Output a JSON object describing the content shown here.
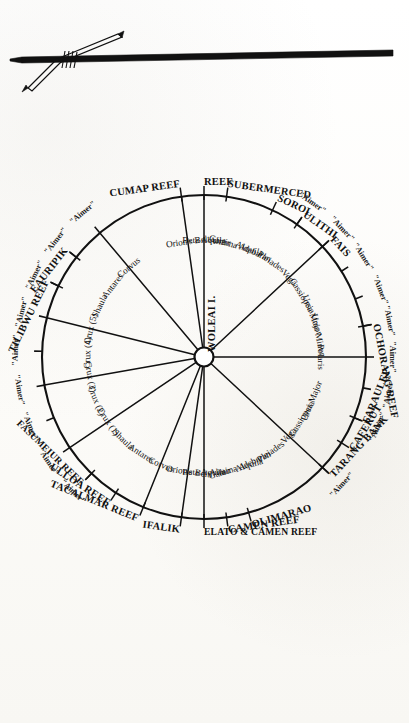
{
  "figure": {
    "center_label": "WOLEAI I.",
    "instrument": "crossed-sticks-navigation-charm",
    "aimer_label": "\"Aimer\"",
    "ink_color": "#111111",
    "paper_color": "#fdfdfb"
  },
  "caption": {
    "text": ""
  },
  "chart_data": {
    "type": "radial-compass",
    "center": "WOLEAI I.",
    "note": "Rotated 90° clockwise on the page. Inner radial labels are star / constellation bearings; outer labels are island and reef destinations; short ticks outside the circle are marked \"Aimer\".",
    "rays": [
      {
        "destination": "FARAULEP",
        "star": "Ursa Major",
        "angle_deg": 292
      },
      {
        "destination": "CAFERUT",
        "star": "Cassiopeia",
        "angle_deg": 302
      },
      {
        "destination": "TARANG BANK",
        "star": "Vega",
        "angle_deg": 313
      },
      {
        "destination": "",
        "star": "Pleiades",
        "angle_deg": 325
      },
      {
        "destination": "",
        "star": "Aldebaran",
        "angle_deg": 335
      },
      {
        "destination": "OLIMARAO",
        "star": "Gamma Aquila",
        "angle_deg": 344
      },
      {
        "destination": "CAMEN REEF",
        "star": "Altair",
        "angle_deg": 352
      },
      {
        "destination": "ELATO & CAMEN REEF",
        "star": "Beta Aquila",
        "angle_deg": 0
      },
      {
        "destination": "IFALIK",
        "star": "Orion's Belt",
        "angle_deg": 8
      },
      {
        "destination": "TACALMAR REEF",
        "star": "Corvus",
        "angle_deg": 22
      },
      {
        "destination": "ULLOA REEF",
        "star": "Antares",
        "angle_deg": 33
      },
      {
        "destination": "FASUMEIUR REEF",
        "star": "Shaula",
        "angle_deg": 44
      },
      {
        "destination": "",
        "star": "Crux (1)",
        "angle_deg": 56
      },
      {
        "destination": "",
        "star": "Crux (2)",
        "angle_deg": 68
      },
      {
        "destination": "",
        "star": "Crux (3)",
        "angle_deg": 80
      },
      {
        "destination": "",
        "star": "Crux (4)",
        "angle_deg": 92
      },
      {
        "destination": "",
        "star": "Crux (5)",
        "angle_deg": 104
      },
      {
        "destination": "TILIBWU REEF",
        "star": "Shaula",
        "angle_deg": 116
      },
      {
        "destination": "EAURIPIK",
        "star": "Antares",
        "angle_deg": 128
      },
      {
        "destination": "",
        "star": "Corvus",
        "angle_deg": 140
      },
      {
        "destination": "CUMAP REEF",
        "star": "Orion's Belt",
        "angle_deg": 172
      },
      {
        "destination": "REEF",
        "star": "Beta Aquila",
        "angle_deg": 180
      },
      {
        "destination": "SUBERMERCED",
        "star": "Altair",
        "angle_deg": 188
      },
      {
        "destination": "",
        "star": "Gamma Aquila",
        "angle_deg": 196
      },
      {
        "destination": "SOROL",
        "star": "Aldebaran",
        "angle_deg": 205
      },
      {
        "destination": "ULITHI",
        "star": "Pleiades",
        "angle_deg": 215
      },
      {
        "destination": "FAIS",
        "star": "Vega",
        "angle_deg": 227
      },
      {
        "destination": "",
        "star": "Cassiopeia",
        "angle_deg": 238
      },
      {
        "destination": "",
        "star": "Ursa Major",
        "angle_deg": 249
      },
      {
        "destination": "OCHORANG REEF",
        "star": "Ursa Minor",
        "angle_deg": 259
      },
      {
        "destination": "",
        "star": "Polaris",
        "angle_deg": 270
      }
    ],
    "outer_labels": [
      "FARAULEP",
      "CAFERUT",
      "TARANG BANK",
      "OLIMARAO",
      "CAMEN REEF",
      "ELATO & CAMEN REEF",
      "IFALIK",
      "TACALMAR REEF",
      "ULLOA REEF",
      "FASUMEIUR REEF",
      "TILIBWU REEF",
      "EAURIPIK",
      "CUMAP REEF",
      "SUBERMERCED",
      "REEF",
      "SOROL",
      "ULITHI",
      "FAIS",
      "OCHORANG REEF"
    ],
    "star_labels": [
      "Polaris",
      "Ursa Minor",
      "Ursa Major",
      "Cassiopeia",
      "Vega",
      "Pleiades",
      "Aldebaran",
      "Gamma Aquila",
      "Altair",
      "Beta Aquila",
      "Orion's Belt",
      "Corvus",
      "Antares",
      "Shaula",
      "Crux (1)",
      "Crux (2)",
      "Crux (3)",
      "Crux (4)",
      "Crux (5)"
    ],
    "aimer_count": 14
  }
}
